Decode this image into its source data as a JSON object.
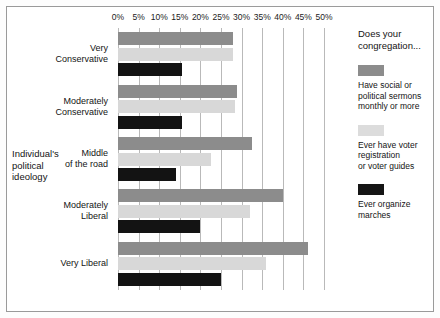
{
  "chart_data": {
    "type": "bar",
    "orientation": "horizontal",
    "title": "",
    "xlabel": "",
    "ylabel": "Individual's political ideology",
    "xlim": [
      0,
      50
    ],
    "xtick_labels": [
      "0%",
      "5%",
      "10%",
      "15%",
      "20%",
      "25%",
      "30%",
      "35%",
      "40%",
      "45%",
      "50%"
    ],
    "xtick_values": [
      0,
      5,
      10,
      15,
      20,
      25,
      30,
      35,
      40,
      45,
      50
    ],
    "grid": true,
    "legend_position": "right",
    "categories": [
      "Very Conservative",
      "Moderately Conservative",
      "Middle of the road",
      "Moderately Liberal",
      "Very Liberal"
    ],
    "category_lines": [
      [
        "Very",
        "Conservative"
      ],
      [
        "Moderately",
        "Conservative"
      ],
      [
        "Middle",
        "of the road"
      ],
      [
        "Moderately",
        "Liberal"
      ],
      [
        "Very Liberal"
      ]
    ],
    "series": [
      {
        "name": "Have social or political sermons monthly or more",
        "color": "#8c8c8c",
        "values": [
          28,
          29,
          32.5,
          40,
          46
        ]
      },
      {
        "name": "Ever have voter registration or voter guides",
        "color": "#d8d8d8",
        "values": [
          28,
          28.5,
          22.5,
          32,
          36
        ]
      },
      {
        "name": "Ever organize marches",
        "color": "#131313",
        "values": [
          15.5,
          15.5,
          14,
          20,
          25
        ]
      }
    ]
  },
  "axis_title": {
    "lines": [
      "Individual's",
      "political",
      "ideology"
    ]
  },
  "legend": {
    "title_lines": [
      "Does your",
      "congregation..."
    ],
    "items": [
      {
        "swatch": "#8c8c8c",
        "lines": [
          "Have social or",
          "political sermons",
          "monthly or more"
        ]
      },
      {
        "swatch": "#dcdcdc",
        "lines": [
          "Ever have voter",
          "registration",
          "or voter guides"
        ]
      },
      {
        "swatch": "#151515",
        "lines": [
          "Ever organize",
          "marches"
        ]
      }
    ]
  }
}
